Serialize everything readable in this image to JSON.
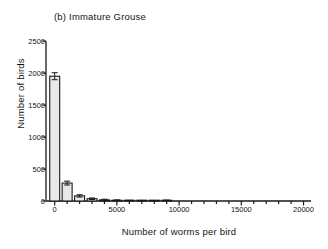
{
  "chart_data": {
    "type": "bar",
    "title": "(b)  Immature Grouse",
    "panel_letter": "(b)",
    "xlabel": "Number of worms per bird",
    "ylabel": "Number of birds",
    "xlim": [
      -700,
      20600
    ],
    "ylim": [
      0,
      2500
    ],
    "xticks": [
      0,
      5000,
      10000,
      15000,
      20000
    ],
    "xtick_labels": [
      "0",
      "5000",
      "10000",
      "15000",
      "20000"
    ],
    "yticks": [
      0,
      500,
      1000,
      1500,
      2000,
      2500
    ],
    "ytick_labels": [
      "0",
      "500",
      "1000",
      "1500",
      "2000",
      "2500"
    ],
    "x_minor_tick_interval": 1000,
    "grid": false,
    "legend": null,
    "bar_width": 800,
    "bar_fill": "#e9e9e9",
    "bar_edge": "#1a1a1a",
    "axis_color": "#1a1a1a",
    "categories": [
      0,
      1000,
      2000,
      3000,
      4000,
      5000,
      6000,
      7000,
      8000,
      9000
    ],
    "values": [
      1950,
      280,
      80,
      35,
      18,
      10,
      5,
      4,
      3,
      6
    ],
    "errors": [
      55,
      30,
      18,
      12,
      10,
      8,
      6,
      5,
      5,
      8
    ],
    "series": [
      {
        "name": "Number of birds",
        "values": [
          1950,
          280,
          80,
          35,
          18,
          10,
          5,
          4,
          3,
          6
        ]
      }
    ]
  }
}
